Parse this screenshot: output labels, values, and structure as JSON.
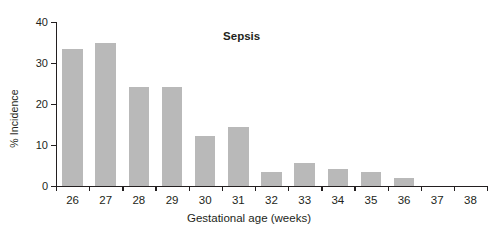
{
  "chart_data": {
    "type": "bar",
    "title": "Sepsis",
    "xlabel": "Gestational age (weeks)",
    "ylabel": "% Incidence",
    "categories": [
      "26",
      "27",
      "28",
      "29",
      "30",
      "31",
      "32",
      "33",
      "34",
      "35",
      "36",
      "37",
      "38"
    ],
    "values": [
      33.4,
      35.0,
      24.1,
      24.1,
      12.2,
      14.3,
      3.3,
      5.5,
      4.2,
      3.3,
      2.0,
      0,
      0
    ],
    "ylim": [
      0,
      40
    ],
    "yticks": [
      0,
      10,
      20,
      30,
      40
    ],
    "ytick_labels": [
      "0",
      "10",
      "20",
      "30",
      "40"
    ],
    "grid": false,
    "legend": false,
    "bar_color": "#b9b9b9",
    "axis_color": "#231f20",
    "title_position": "top-center-inside"
  }
}
